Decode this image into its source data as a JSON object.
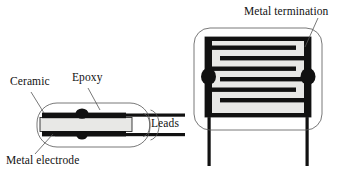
{
  "figure": {
    "background_color": "#ffffff",
    "ink_color": "#111111",
    "ceramic_fill": "#e8e8e6",
    "epoxy_fill": "#ffffff",
    "electrode_fill": "#111111"
  },
  "labels": {
    "ceramic": "Ceramic",
    "epoxy": "Epoxy",
    "metal_electrode": "Metal electrode",
    "leads": "Leads",
    "metal_termination": "Metal termination"
  },
  "views": {
    "left": {
      "name": "cross-section view",
      "parts": [
        "epoxy-encapsulation",
        "ceramic-body",
        "metal-electrode",
        "lead-wire-top",
        "lead-wire-bottom",
        "solder-blob"
      ]
    },
    "right": {
      "name": "cutaway front view",
      "electrode_layer_count": 8,
      "parts": [
        "epoxy-encapsulation",
        "ceramic-body",
        "interdigitated-electrodes",
        "metal-termination-left",
        "metal-termination-right",
        "solder-blob-left",
        "solder-blob-right",
        "lead-wire-left",
        "lead-wire-right"
      ]
    }
  }
}
